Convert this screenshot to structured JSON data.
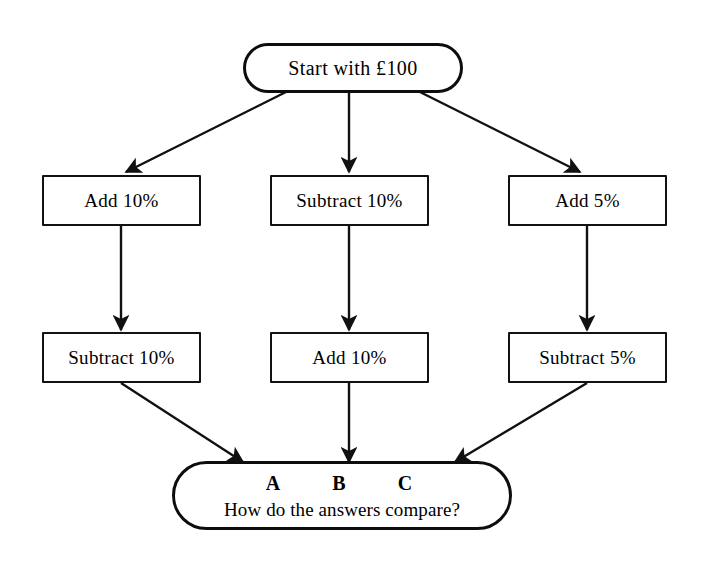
{
  "diagram": {
    "background_color": "#ffffff",
    "line_color": "#111111",
    "start": {
      "label": "Start with £100",
      "shape": "stadium"
    },
    "branches": [
      {
        "id": "branch-a",
        "letter": "A",
        "step1": "Add 10%",
        "step2": "Subtract 10%"
      },
      {
        "id": "branch-b",
        "letter": "B",
        "step1": "Subtract 10%",
        "step2": "Add 10%"
      },
      {
        "id": "branch-c",
        "letter": "C",
        "step1": "Add 5%",
        "step2": "Subtract 5%"
      }
    ],
    "end": {
      "letters": [
        "A",
        "B",
        "C"
      ],
      "question": "How do the answers compare?",
      "shape": "stadium"
    }
  }
}
